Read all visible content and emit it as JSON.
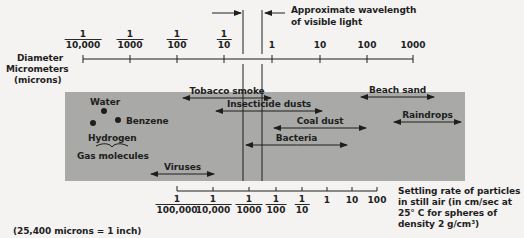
{
  "top_axis": {
    "label_lines": [
      "Diameter",
      "Micrometers",
      "(microns)"
    ],
    "ticks": [
      {
        "x": 83,
        "num": "1",
        "den": "10,000"
      },
      {
        "x": 130,
        "num": "1",
        "den": "1000"
      },
      {
        "x": 177,
        "num": "1",
        "den": "100"
      },
      {
        "x": 224,
        "num": "1",
        "den": "10"
      },
      {
        "x": 272,
        "whole": "1"
      },
      {
        "x": 320,
        "whole": "10"
      },
      {
        "x": 367,
        "whole": "100"
      },
      {
        "x": 413,
        "whole": "1000"
      }
    ]
  },
  "visible_light": {
    "label_line1": "Approximate wavelength",
    "label_line2": "of visible light",
    "lines_x": [
      243,
      262
    ]
  },
  "particles": [
    {
      "label": "Tobacco smoke",
      "x1": 182,
      "x2": 272,
      "y": 98
    },
    {
      "label": "Insecticide dusts",
      "x1": 215,
      "x2": 323,
      "y": 111
    },
    {
      "label": "Coal dust",
      "x1": 273,
      "x2": 367,
      "y": 128
    },
    {
      "label": "Bacteria",
      "x1": 245,
      "x2": 348,
      "y": 145
    },
    {
      "label": "Beach sand",
      "x1": 360,
      "x2": 435,
      "y": 97
    },
    {
      "label": "Raindrops",
      "x1": 393,
      "x2": 462,
      "y": 122
    },
    {
      "label": "Viruses",
      "x1": 150,
      "x2": 215,
      "y": 174
    }
  ],
  "gas_molecules": {
    "group_label": "Gas molecules",
    "water": "Water",
    "benzene": "Benzene",
    "hydrogen": "Hydrogen"
  },
  "bottom_axis": {
    "caption_lines": [
      "Settling rate of particles",
      "in still air (in cm/sec at",
      "25° C for spheres of",
      "density 2 g/cm³)"
    ],
    "ticks": [
      {
        "x": 177,
        "num": "1",
        "den": "100,000"
      },
      {
        "x": 213,
        "num": "1",
        "den": "10,000"
      },
      {
        "x": 249,
        "num": "1",
        "den": "1000"
      },
      {
        "x": 276,
        "num": "1",
        "den": "100"
      },
      {
        "x": 302,
        "num": "1",
        "den": "10"
      },
      {
        "x": 327,
        "whole": "1"
      },
      {
        "x": 352,
        "whole": "10"
      },
      {
        "x": 377,
        "whole": "100"
      }
    ]
  },
  "footnote": "(25,400 microns = 1 inch)",
  "colors": {
    "band": "#a9a9a7",
    "ink": "#1e1e1e",
    "background": "#f4f3f1"
  }
}
